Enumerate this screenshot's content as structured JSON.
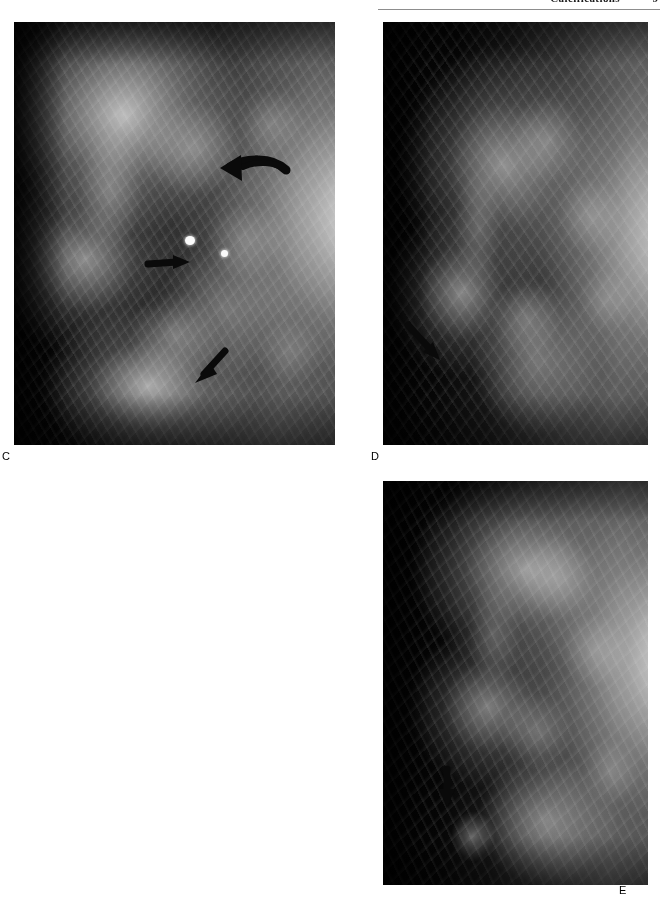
{
  "header": {
    "title": "Calcifications",
    "page_number": "9"
  },
  "figure": {
    "panels": [
      {
        "id": "C",
        "label": "C",
        "modality": "mammogram",
        "view": "mediolateral-oblique",
        "annotations": [
          {
            "type": "curved-arrow",
            "direction": "left",
            "name": "curved-arrow-upper"
          },
          {
            "type": "straight-arrow",
            "direction": "right",
            "name": "arrow-middle"
          },
          {
            "type": "straight-arrow",
            "direction": "up-left",
            "name": "arrow-lower"
          },
          {
            "type": "calcification",
            "name": "calcification-large"
          },
          {
            "type": "calcification",
            "name": "calcification-small"
          }
        ]
      },
      {
        "id": "D",
        "label": "D",
        "modality": "mammogram",
        "view": "craniocaudal",
        "annotations": [
          {
            "type": "straight-arrow",
            "direction": "down-right",
            "name": "arrow-lesion"
          }
        ]
      },
      {
        "id": "E",
        "label": "E",
        "modality": "mammogram",
        "view": "magnification",
        "annotations": [
          {
            "type": "straight-arrow",
            "direction": "down",
            "name": "arrow-lesion"
          }
        ]
      }
    ]
  }
}
